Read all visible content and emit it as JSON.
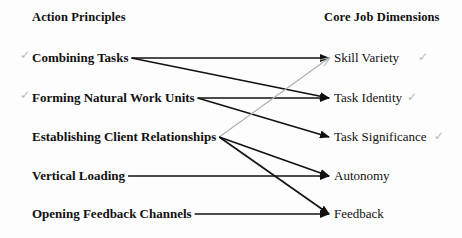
{
  "headers": {
    "left": "Action Principles",
    "right": "Core Job Dimensions"
  },
  "action_principles": [
    {
      "id": "combining",
      "label": "Combining Tasks",
      "checked": true
    },
    {
      "id": "forming",
      "label": "Forming Natural Work Units",
      "checked": true
    },
    {
      "id": "establishing",
      "label": "Establishing Client Relationships",
      "checked": false
    },
    {
      "id": "vertical",
      "label": "Vertical Loading",
      "checked": false
    },
    {
      "id": "opening",
      "label": "Opening Feedback Channels",
      "checked": false
    }
  ],
  "core_dimensions": [
    {
      "id": "skill",
      "label": "Skill Variety",
      "checked": true
    },
    {
      "id": "identity",
      "label": "Task Identity",
      "checked": true
    },
    {
      "id": "significance",
      "label": "Task Significance",
      "checked": true
    },
    {
      "id": "autonomy",
      "label": "Autonomy",
      "checked": false
    },
    {
      "id": "feedback",
      "label": "Feedback",
      "checked": false
    }
  ],
  "links": [
    {
      "from": "combining",
      "to": "skill",
      "style": "ink"
    },
    {
      "from": "combining",
      "to": "identity",
      "style": "ink"
    },
    {
      "from": "forming",
      "to": "identity",
      "style": "ink"
    },
    {
      "from": "forming",
      "to": "significance",
      "style": "ink"
    },
    {
      "from": "establishing",
      "to": "skill",
      "style": "pencil"
    },
    {
      "from": "establishing",
      "to": "autonomy",
      "style": "ink"
    },
    {
      "from": "establishing",
      "to": "feedback",
      "style": "ink"
    },
    {
      "from": "vertical",
      "to": "autonomy",
      "style": "ink"
    },
    {
      "from": "opening",
      "to": "feedback",
      "style": "ink"
    }
  ],
  "colors": {
    "ink": "#111111",
    "pencil": "#b0b0b0"
  },
  "check_glyph": "✓"
}
